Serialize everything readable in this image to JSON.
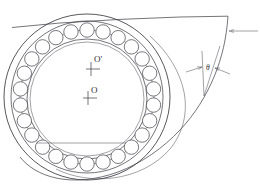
{
  "figure": {
    "background_color": "#ffffff",
    "line_color": "#3a3a40",
    "width": 260,
    "height": 188
  },
  "labels": {
    "center_outer": "O'",
    "center_inner": "O",
    "angle": "θ"
  },
  "bearing": {
    "center_x": 87,
    "center_y": 97,
    "housing_radius": 83,
    "outer_race_radius": 76,
    "ball_pitch_radius": 67,
    "inner_race_outer_radius": 60,
    "bore_radius": 57,
    "ball_count": 26,
    "ball_radius": 7.2,
    "inner_center_x": 87,
    "inner_center_y": 99
  },
  "chord": {
    "x1": 37,
    "x2": 126,
    "y": 143
  },
  "cam": {
    "apex_x": 228,
    "apex_y": 16,
    "tangent_start_x": 12,
    "tangent_start_y": 27
  },
  "leader": {
    "x_start": 228,
    "x_end": 258,
    "y": 31
  },
  "angle_marker": {
    "label_x": 209,
    "label_y": 69,
    "arrow_left_x": 188,
    "arrow_left_y": 73,
    "arrow_right_x": 230,
    "arrow_right_y": 74
  }
}
